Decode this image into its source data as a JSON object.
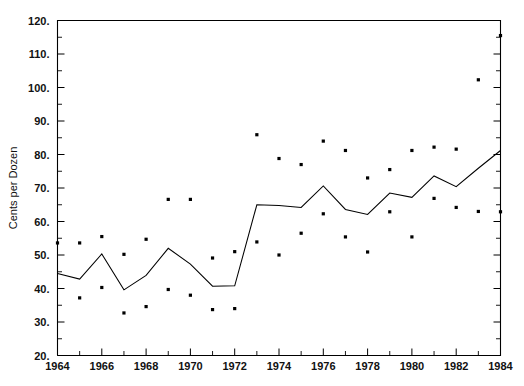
{
  "chart_data": {
    "type": "line",
    "title": "",
    "xlabel": "",
    "ylabel": "Cents per Dozen",
    "xlim": [
      1964,
      1984
    ],
    "ylim": [
      20,
      120
    ],
    "y_ticks": [
      20,
      30,
      40,
      50,
      60,
      70,
      80,
      90,
      100,
      110,
      120
    ],
    "y_tick_labels": [
      "20.",
      "30.",
      "40.",
      "50.",
      "60.",
      "70.",
      "80.",
      "90.",
      "100.",
      "110.",
      "120."
    ],
    "y_minor_step": 5,
    "x_ticks": [
      1964,
      1965,
      1966,
      1967,
      1968,
      1969,
      1970,
      1971,
      1972,
      1973,
      1974,
      1975,
      1976,
      1977,
      1978,
      1979,
      1980,
      1981,
      1982,
      1983,
      1984
    ],
    "x_tick_labels": [
      "1964",
      "",
      "1966",
      "",
      "1968",
      "",
      "1970",
      "",
      "1972",
      "",
      "1974",
      "",
      "1976",
      "",
      "1978",
      "",
      "1980",
      "",
      "1982",
      "",
      "1984"
    ],
    "grid": false,
    "legend": "none",
    "series": [
      {
        "name": "Annual average price",
        "render": "line",
        "x": [
          1964,
          1965,
          1966,
          1967,
          1968,
          1969,
          1970,
          1971,
          1972,
          1973,
          1974,
          1975,
          1976,
          1977,
          1978,
          1979,
          1980,
          1981,
          1982,
          1983,
          1984
        ],
        "values": [
          44.5,
          42.8,
          50.3,
          39.6,
          43.9,
          52.0,
          47.3,
          40.7,
          40.8,
          65.0,
          64.8,
          64.2,
          70.6,
          63.6,
          62.1,
          68.5,
          67.2,
          73.6,
          70.4,
          75.9,
          81.2
        ]
      },
      {
        "name": "Yearly high",
        "render": "scatter",
        "points": [
          [
            1964,
            53.6
          ],
          [
            1965,
            53.6
          ],
          [
            1966,
            55.5
          ],
          [
            1967,
            50.2
          ],
          [
            1968,
            54.7
          ],
          [
            1969,
            66.6
          ],
          [
            1970,
            66.6
          ],
          [
            1971,
            49.1
          ],
          [
            1972,
            51.0
          ],
          [
            1973,
            85.9
          ],
          [
            1974,
            78.8
          ],
          [
            1975,
            77.0
          ],
          [
            1976,
            84.0
          ],
          [
            1977,
            81.2
          ],
          [
            1978,
            73.0
          ],
          [
            1979,
            75.5
          ],
          [
            1980,
            81.2
          ],
          [
            1981,
            82.2
          ],
          [
            1982,
            81.6
          ],
          [
            1983,
            102.3
          ],
          [
            1984,
            115.5
          ]
        ]
      },
      {
        "name": "Yearly low",
        "render": "scatter",
        "points": [
          [
            1965,
            37.2
          ],
          [
            1966,
            40.3
          ],
          [
            1967,
            32.7
          ],
          [
            1968,
            34.6
          ],
          [
            1969,
            39.7
          ],
          [
            1970,
            38.0
          ],
          [
            1971,
            33.7
          ],
          [
            1972,
            34.0
          ],
          [
            1973,
            53.9
          ],
          [
            1974,
            50.0
          ],
          [
            1975,
            56.5
          ],
          [
            1976,
            62.3
          ],
          [
            1977,
            55.4
          ],
          [
            1978,
            50.9
          ],
          [
            1979,
            62.9
          ],
          [
            1980,
            55.4
          ],
          [
            1981,
            66.9
          ],
          [
            1982,
            64.2
          ],
          [
            1983,
            63.0
          ],
          [
            1984,
            62.9
          ]
        ]
      }
    ]
  },
  "axis": {
    "y_title": "Cents per Dozen"
  },
  "colors": {
    "line": "#000000",
    "point": "#000000",
    "axis": "#000000",
    "background": "#ffffff"
  }
}
